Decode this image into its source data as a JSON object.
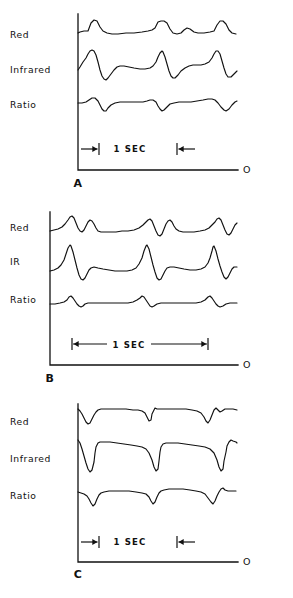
{
  "figure": {
    "background_color": "#ffffff",
    "ink_color": "#111111",
    "width": 293,
    "height": 598
  },
  "panels": [
    {
      "letter": "A",
      "letter_x": 78,
      "letter_y": 187,
      "axis": {
        "x": 78,
        "y_top": 14,
        "y_bottom": 170,
        "x_right": 238
      },
      "origin_label": "O",
      "origin_x": 243,
      "origin_y": 173,
      "traces": [
        {
          "name": "Red",
          "label": "Red",
          "label_x": 10,
          "label_y": 38,
          "baseline_y": 33
        },
        {
          "name": "Infrared",
          "label": "Infrared",
          "label_x": 10,
          "label_y": 73,
          "baseline_y": 70
        },
        {
          "name": "Ratio",
          "label": "Ratio",
          "label_x": 10,
          "label_y": 108,
          "baseline_y": 103
        }
      ],
      "scale": {
        "label": "1 SEC",
        "label_x": 130,
        "label_y": 152,
        "style": "inward-arrows",
        "left_tick_x": 99,
        "right_tick_x": 177,
        "tick_y": 149,
        "tick_half_height": 6,
        "tail_length": 18
      }
    },
    {
      "letter": "B",
      "letter_x": 50,
      "letter_y": 382,
      "axis": {
        "x": 50,
        "y_top": 212,
        "y_bottom": 365,
        "x_right": 238
      },
      "origin_label": "O",
      "origin_x": 243,
      "origin_y": 368,
      "traces": [
        {
          "name": "Red",
          "label": "Red",
          "label_x": 10,
          "label_y": 231,
          "baseline_y": 231
        },
        {
          "name": "IR",
          "label": "IR",
          "label_x": 10,
          "label_y": 265,
          "baseline_y": 271
        },
        {
          "name": "Ratio",
          "label": "Ratio",
          "label_x": 10,
          "label_y": 303,
          "baseline_y": 304
        }
      ],
      "scale": {
        "label": "1 SEC",
        "label_x": 129,
        "label_y": 348,
        "style": "span-arrows",
        "left_tick_x": 72,
        "right_tick_x": 208,
        "tick_y": 344,
        "tick_half_height": 6
      }
    },
    {
      "letter": "C",
      "letter_x": 78,
      "letter_y": 578,
      "axis": {
        "x": 78,
        "y_top": 404,
        "y_bottom": 562,
        "x_right": 238
      },
      "origin_label": "O",
      "origin_x": 243,
      "origin_y": 565,
      "traces": [
        {
          "name": "Red",
          "label": "Red",
          "label_x": 10,
          "label_y": 425,
          "baseline_y": 412
        },
        {
          "name": "Infrared",
          "label": "Infrared",
          "label_x": 10,
          "label_y": 462,
          "baseline_y": 447
        },
        {
          "name": "Ratio",
          "label": "Ratio",
          "label_x": 10,
          "label_y": 499,
          "baseline_y": 493
        }
      ],
      "scale": {
        "label": "1 SEC",
        "label_x": 130,
        "label_y": 545,
        "style": "inward-arrows",
        "left_tick_x": 99,
        "right_tick_x": 177,
        "tick_y": 542,
        "tick_half_height": 6,
        "tail_length": 18
      }
    }
  ],
  "chart_data": {
    "type": "line",
    "xlabel": "time",
    "ylabel": "signal amplitude (arbitrary units)",
    "grid": false,
    "legend_position": "left-of-axis",
    "time_scale_label": "1 SEC",
    "panels": [
      {
        "panel": "A",
        "description": "Normal pulsatile signals: small upward bumps on Red, large upward pulses on Infrared, small downward dips on Ratio",
        "x_range": [
          78,
          238
        ],
        "series": [
          {
            "name": "Red",
            "baseline_y": 33,
            "points": "78,33 80,32 84,31 88,31 91,23 94,20 97,21 100,27 103,31 107,33 112,34 118,34 126,33 134,33 142,32 148,31 152,30 155,28 158,22 161,21 164,21 167,23 170,29 173,33 177,34 181,33 184,30 187,28 190,29 194,32 198,33 204,33 210,32 214,31 217,25 220,21 223,21 226,24 229,30 232,33 236,34"
          },
          {
            "name": "Infrared",
            "baseline_y": 70,
            "points": "78,70 80,67 83,62 86,58 88,54 90,51 92,50 94,51 96,55 98,62 100,70 102,76 104,79 106,80 108,78 111,74 114,70 117,67 120,66 124,66 129,67 134,68 140,69 145,69 150,68 153,66 156,62 158,57 160,53 162,51 163,52 165,57 167,64 169,71 171,76 173,78 175,78 178,75 181,71 185,68 189,66 193,65 197,65 201,65 205,64 209,62 212,58 214,54 216,51 218,51 220,54 222,61 224,68 226,74 228,77 231,77 234,74 237,71"
          },
          {
            "name": "Ratio",
            "baseline_y": 103,
            "points": "78,103 82,103 86,102 89,100 92,98 95,98 98,101 100,105 102,109 104,111 106,111 108,108 111,105 115,103 120,102 126,102 132,102 138,102 143,102 147,101 150,100 153,100 156,102 158,106 160,109 162,111 164,110 167,107 170,104 174,103 179,102 185,102 191,102 197,101 203,100 208,99 212,99 215,100 218,103 221,107 224,110 226,111 229,109 232,105 235,102 237,101"
          }
        ]
      },
      {
        "panel": "B",
        "description": "Faster, sharper pulses: Red shows twin peaks, IR shows tall narrow spikes with undershoot, Ratio shows small paired bumps",
        "x_range": [
          50,
          238
        ],
        "series": [
          {
            "name": "Red",
            "baseline_y": 231,
            "points": "50,231 54,230 58,229 62,227 65,224 68,220 70,217 72,216 74,218 76,223 78,228 80,231 82,232 84,230 86,226 88,222 90,220 92,221 94,224 96,228 98,231 101,232 105,232 110,232 116,232 122,231 128,231 134,230 139,228 143,225 146,222 148,220 150,219 152,221 154,226 156,231 158,235 160,236 162,234 164,229 166,224 168,221 170,220 172,222 174,226 176,229 179,231 183,232 188,232 194,232 200,231 205,230 209,228 212,225 215,222 217,219 219,218 221,220 223,225 225,230 227,234 229,235 231,233 233,229 235,225 237,223"
          },
          {
            "name": "IR",
            "baseline_y": 271,
            "points": "50,271 54,270 58,268 61,265 64,260 66,254 68,248 70,245 71,246 73,252 75,260 77,268 79,275 81,279 83,280 85,278 87,274 89,270 91,268 94,267 98,268 103,269 109,270 115,271 121,271 127,271 132,270 136,268 139,264 142,258 144,251 146,246 147,245 149,249 151,257 153,265 155,272 157,278 159,280 161,279 163,275 165,271 167,268 170,267 174,267 179,268 184,269 190,270 196,270 201,269 205,267 208,263 210,258 212,251 213,247 214,246 216,251 218,259 220,266 222,272 224,277 226,279 228,277 230,273 232,269 234,267 237,267"
          },
          {
            "name": "Ratio",
            "baseline_y": 304,
            "points": "50,304 55,304 60,303 64,302 67,300 69,297 71,296 73,298 75,301 77,304 79,306 81,307 83,306 85,304 88,303 92,303 98,303 104,303 110,303 116,303 122,303 128,303 133,302 137,300 140,298 142,296 144,297 146,300 148,303 150,306 152,307 154,306 157,304 161,303 166,303 172,303 178,303 184,303 190,303 196,303 201,302 205,300 208,297 210,296 212,298 214,301 216,304 218,306 220,307 223,306 226,304 230,303 234,303 237,303"
          }
        ]
      },
      {
        "panel": "C",
        "description": "Inverted/negative-going signals: sharp downward deflections followed by flat plateaus on all three channels",
        "x_range": [
          78,
          238
        ],
        "series": [
          {
            "name": "Red",
            "baseline_y": 412,
            "points": "78,409 80,411 82,414 84,418 86,422 88,424 90,423 92,419 94,415 96,412 98,410 101,409 106,409 112,409 119,409 126,409 133,410 138,410 142,411 145,413 147,417 149,421 151,420 152,414 154,410 155,408 157,409 160,409 165,409 172,409 179,409 186,409 192,410 197,411 201,413 204,417 206,421 208,423 210,420 212,415 214,410 216,408 218,410 220,412 222,411 225,409 229,409 233,409 237,410"
          },
          {
            "name": "Infrared",
            "baseline_y": 447,
            "points": "78,440 80,443 82,449 84,456 86,463 88,469 90,472 92,470 94,462 95,453 96,447 98,443 100,442 104,442 110,442 117,443 124,444 131,445 137,446 142,447 146,449 149,453 152,460 154,467 156,471 158,469 159,461 160,452 161,447 163,444 166,443 171,443 178,443 185,444 192,445 199,446 205,447 210,449 214,453 217,460 219,467 221,471 223,469 224,461 226,452 227,446 229,442 231,440 233,441 236,442 237,443"
          },
          {
            "name": "Ratio",
            "baseline_y": 493,
            "points": "78,492 81,493 84,494 87,496 89,499 91,503 93,506 95,504 97,499 99,495 101,493 104,492 109,491 115,491 122,491 129,491 136,492 142,493 146,494 149,497 151,501 153,504 155,502 157,497 159,493 161,491 164,490 169,489 176,489 183,489 190,490 196,491 201,492 205,494 208,498 211,502 213,504 215,501 217,496 219,492 221,489 223,488 225,490 228,491 232,491 236,491"
          }
        ]
      }
    ]
  }
}
